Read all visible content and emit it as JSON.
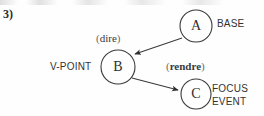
{
  "figure": {
    "item_number": "3)",
    "background_color": "#fefefe",
    "stroke_color": "#3a3a3a"
  },
  "nodes": [
    {
      "id": "A",
      "letter": "A",
      "role_label": "BASE",
      "cx": 196,
      "cy": 26,
      "r": 16
    },
    {
      "id": "B",
      "letter": "B",
      "role_label": "V-POINT",
      "verb": "dire",
      "verb_bold": false,
      "cx": 118,
      "cy": 67,
      "r": 17
    },
    {
      "id": "C",
      "letter": "C",
      "role_label_1": "FOCUS",
      "role_label_2": "EVENT",
      "verb": "rendre",
      "verb_bold": true,
      "cx": 196,
      "cy": 94,
      "r": 15
    }
  ],
  "edges": [
    {
      "from": "A",
      "to": "B",
      "arrowhead": "filled-triangle"
    },
    {
      "from": "B",
      "to": "C",
      "arrowhead": "filled-triangle"
    }
  ],
  "paren_open": "(",
  "paren_close": ")"
}
